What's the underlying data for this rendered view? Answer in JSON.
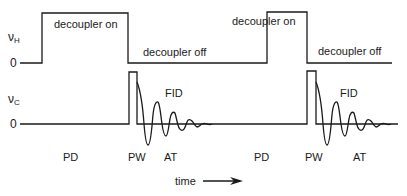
{
  "diagram": {
    "channels": {
      "h": {
        "symbol": "ν",
        "subscript": "H",
        "zero": "0"
      },
      "c": {
        "symbol": "ν",
        "subscript": "C",
        "zero": "0"
      }
    },
    "labels": {
      "decoupler_on_1": "decoupler on",
      "decoupler_off_1": "decoupler off",
      "decoupler_on_2": "decoupler on",
      "decoupler_off_2": "decoupler off",
      "fid_1": "FID",
      "fid_2": "FID",
      "pd_1": "PD",
      "pw_1": "PW",
      "at_1": "AT",
      "pd_2": "PD",
      "pw_2": "PW",
      "at_2": "AT",
      "time": "time"
    },
    "line_color": "#1a1a1a"
  }
}
